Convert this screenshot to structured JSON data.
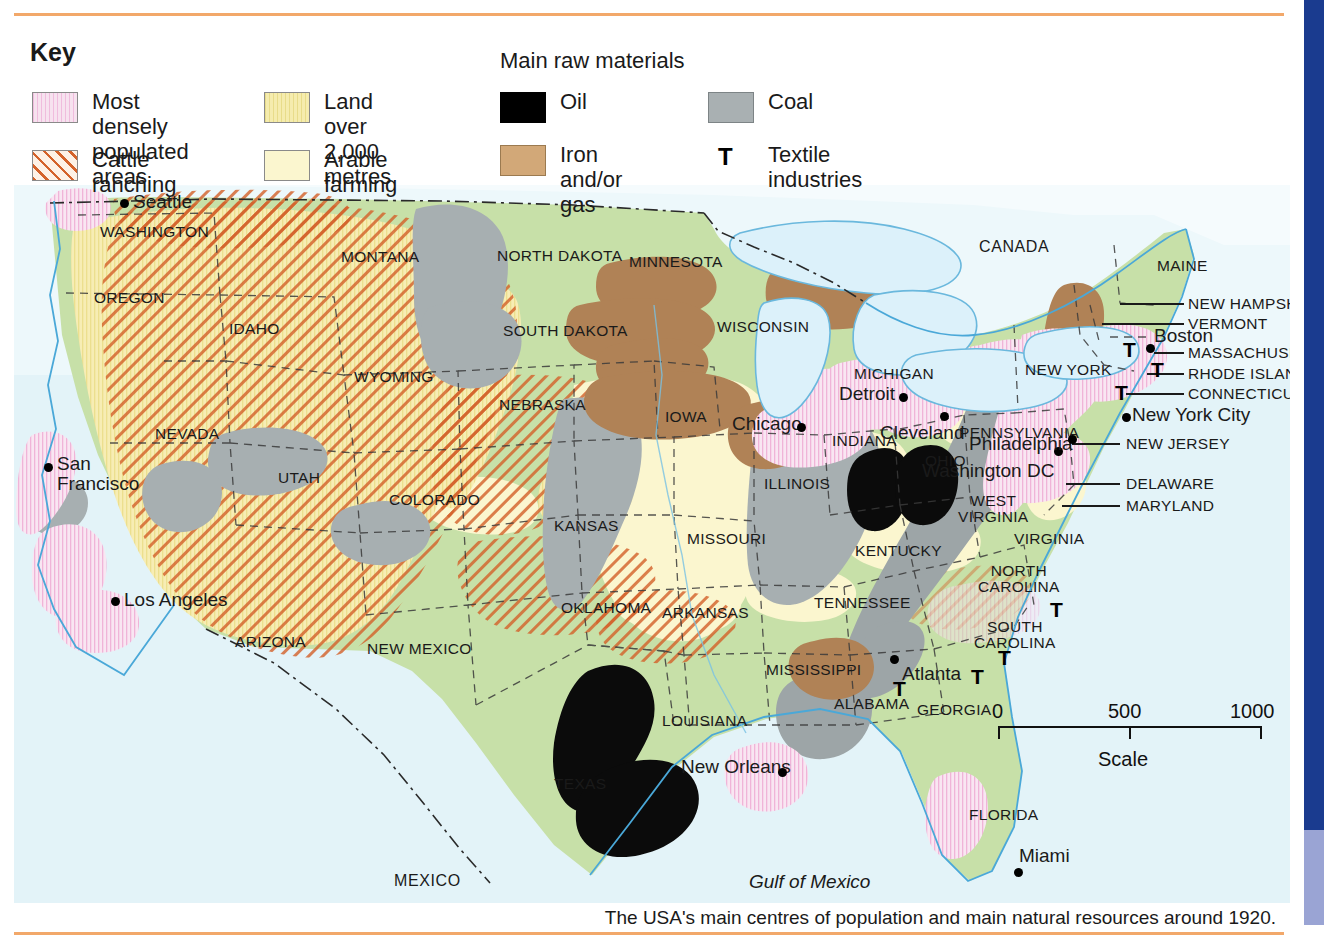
{
  "figure": {
    "top_rule_color": "#f2a86a",
    "page_edge_color": "#1a3b8f"
  },
  "legend": {
    "title": "Key",
    "raw_materials_heading": "Main raw materials",
    "items": [
      {
        "id": "most-densely-populated",
        "label": "Most densely\npopulated areas",
        "swatch": "pink-vertical-hatch",
        "color": "#f7e2ef"
      },
      {
        "id": "cattle-ranching",
        "label": "Cattle ranching",
        "swatch": "orange-diagonal-hatch",
        "color": "#d4622a"
      },
      {
        "id": "land-over-2000m",
        "label": "Land over\n2,000 metres",
        "swatch": "sand-vertical-hatch",
        "color": "#f5ecae"
      },
      {
        "id": "arable-farming",
        "label": "Arable farming",
        "swatch": "pale-yellow-solid",
        "color": "#fbf6cf"
      },
      {
        "id": "oil",
        "label": "Oil",
        "swatch": "black-solid",
        "color": "#000000"
      },
      {
        "id": "coal",
        "label": "Coal",
        "swatch": "grey-solid",
        "color": "#a9b0b2"
      },
      {
        "id": "iron-and-or-gas",
        "label": "Iron and/or gas",
        "swatch": "brown-solid",
        "color": "#d2a878"
      },
      {
        "id": "textile-industries",
        "label": "Textile industries",
        "swatch": "letter-T",
        "color": "#000000"
      }
    ]
  },
  "map": {
    "countries": [
      {
        "name": "CANADA",
        "x": 965,
        "y": 53
      },
      {
        "name": "MEXICO",
        "x": 380,
        "y": 687
      }
    ],
    "water": [
      {
        "name": "Gulf of Mexico",
        "x": 735,
        "y": 686
      }
    ],
    "states": [
      {
        "name": "WASHINGTON",
        "x": 86,
        "y": 38
      },
      {
        "name": "OREGON",
        "x": 80,
        "y": 104
      },
      {
        "name": "IDAHO",
        "x": 215,
        "y": 135
      },
      {
        "name": "MONTANA",
        "x": 327,
        "y": 63
      },
      {
        "name": "NORTH DAKOTA",
        "x": 483,
        "y": 62
      },
      {
        "name": "SOUTH DAKOTA",
        "x": 489,
        "y": 137
      },
      {
        "name": "MINNESOTA",
        "x": 615,
        "y": 68
      },
      {
        "name": "WISCONSIN",
        "x": 703,
        "y": 133
      },
      {
        "name": "WYOMING",
        "x": 340,
        "y": 183
      },
      {
        "name": "NEVADA",
        "x": 141,
        "y": 240
      },
      {
        "name": "UTAH",
        "x": 264,
        "y": 284
      },
      {
        "name": "COLORADO",
        "x": 375,
        "y": 306
      },
      {
        "name": "NEBRASKA",
        "x": 485,
        "y": 211
      },
      {
        "name": "IOWA",
        "x": 651,
        "y": 223
      },
      {
        "name": "MICHIGAN",
        "x": 840,
        "y": 180
      },
      {
        "name": "INDIANA",
        "x": 818,
        "y": 247
      },
      {
        "name": "ILLINOIS",
        "x": 750,
        "y": 290
      },
      {
        "name": "KANSAS",
        "x": 540,
        "y": 332
      },
      {
        "name": "MISSOURI",
        "x": 673,
        "y": 345
      },
      {
        "name": "OHIO",
        "x": 911,
        "y": 267
      },
      {
        "name": "KENTUCKY",
        "x": 841,
        "y": 357
      },
      {
        "name": "TENNESSEE",
        "x": 800,
        "y": 409
      },
      {
        "name": "OKLAHOMA",
        "x": 547,
        "y": 414
      },
      {
        "name": "ARKANSAS",
        "x": 648,
        "y": 419
      },
      {
        "name": "ARIZONA",
        "x": 221,
        "y": 448
      },
      {
        "name": "NEW MEXICO",
        "x": 353,
        "y": 455
      },
      {
        "name": "TEXAS",
        "x": 540,
        "y": 590
      },
      {
        "name": "LOUISIANA",
        "x": 648,
        "y": 527
      },
      {
        "name": "MISSISSIPPI",
        "x": 752,
        "y": 476
      },
      {
        "name": "ALABAMA",
        "x": 820,
        "y": 510
      },
      {
        "name": "GEORGIA",
        "x": 903,
        "y": 516
      },
      {
        "name": "FLORIDA",
        "x": 955,
        "y": 621
      },
      {
        "name": "VIRGINIA",
        "x": 1000,
        "y": 345
      },
      {
        "name": "PENNSYLVANIA",
        "x": 945,
        "y": 239
      },
      {
        "name": "NEW YORK",
        "x": 1011,
        "y": 176
      },
      {
        "name": "MAINE",
        "x": 1143,
        "y": 72
      }
    ],
    "states_two_line": [
      {
        "name": "WEST\nVIRGINIA",
        "x": 944,
        "y": 308
      },
      {
        "name": "NORTH\nCAROLINA",
        "x": 964,
        "y": 378
      },
      {
        "name": "SOUTH\nCAROLINA",
        "x": 960,
        "y": 434
      }
    ],
    "leader_states": [
      {
        "name": "NEW HAMPSHIRE",
        "label_x": 1174,
        "label_y": 110,
        "line_x": 1106,
        "line_w": 64,
        "line_y": 118
      },
      {
        "name": "VERMONT",
        "label_x": 1174,
        "label_y": 130,
        "line_x": 1088,
        "line_w": 82,
        "line_y": 138
      },
      {
        "name": "MASSACHUSETTS",
        "label_x": 1174,
        "label_y": 159,
        "line_x": 1140,
        "line_w": 30,
        "line_y": 167
      },
      {
        "name": "RHODE ISLAND",
        "label_x": 1174,
        "label_y": 180,
        "line_x": 1133,
        "line_w": 37,
        "line_y": 188
      },
      {
        "name": "CONNECTICUT",
        "label_x": 1174,
        "label_y": 200,
        "line_x": 1112,
        "line_w": 58,
        "line_y": 208
      },
      {
        "name": "NEW JERSEY",
        "label_x": 1112,
        "label_y": 250,
        "line_x": 1058,
        "line_w": 48,
        "line_y": 258
      },
      {
        "name": "DELAWARE",
        "label_x": 1112,
        "label_y": 290,
        "line_x": 1052,
        "line_w": 54,
        "line_y": 298
      },
      {
        "name": "MARYLAND",
        "label_x": 1112,
        "label_y": 312,
        "line_x": 1048,
        "line_w": 58,
        "line_y": 320
      }
    ],
    "cities": [
      {
        "name": "Seattle",
        "label_x": 119,
        "label_y": 6,
        "dot_x": 106,
        "dot_y": 14
      },
      {
        "name": "San\nFrancisco",
        "label_x": 43,
        "label_y": 269,
        "dot_x": 30,
        "dot_y": 278,
        "two_line": true
      },
      {
        "name": "Los Angeles",
        "label_x": 110,
        "label_y": 404,
        "dot_x": 97,
        "dot_y": 412
      },
      {
        "name": "Chicago",
        "label_x": 718,
        "label_y": 228,
        "dot_x": 783,
        "dot_y": 238
      },
      {
        "name": "Detroit",
        "label_x": 825,
        "label_y": 198,
        "dot_x": 885,
        "dot_y": 208
      },
      {
        "name": "Cleveland",
        "label_x": 866,
        "label_y": 237,
        "dot_x": 926,
        "dot_y": 227
      },
      {
        "name": "Washington DC",
        "label_x": 908,
        "label_y": 275,
        "dot_x": 1040,
        "dot_y": 262
      },
      {
        "name": "Philadelphia",
        "label_x": 955,
        "label_y": 248,
        "dot_x": 1054,
        "dot_y": 250
      },
      {
        "name": "New York City",
        "label_x": 1118,
        "label_y": 219,
        "dot_x": 1108,
        "dot_y": 228
      },
      {
        "name": "Boston",
        "label_x": 1140,
        "label_y": 140,
        "dot_x": 1132,
        "dot_y": 159
      },
      {
        "name": "Atlanta",
        "label_x": 888,
        "label_y": 478,
        "dot_x": 876,
        "dot_y": 470
      },
      {
        "name": "New Orleans",
        "label_x": 667,
        "label_y": 571,
        "dot_x": 764,
        "dot_y": 583
      },
      {
        "name": "Miami",
        "label_x": 1005,
        "label_y": 660,
        "dot_x": 1000,
        "dot_y": 683
      }
    ],
    "textile_markers": [
      {
        "x": 1109,
        "y": 153
      },
      {
        "x": 1137,
        "y": 173
      },
      {
        "x": 1101,
        "y": 196
      },
      {
        "x": 1036,
        "y": 413
      },
      {
        "x": 984,
        "y": 461
      },
      {
        "x": 957,
        "y": 480
      },
      {
        "x": 879,
        "y": 492
      }
    ]
  },
  "north_arrow": {
    "label": "N",
    "x": 1225,
    "y": 90
  },
  "scale": {
    "ticks": [
      "0",
      "500",
      "1000"
    ],
    "caption": "Scale",
    "x": 998,
    "y": 700
  },
  "caption": "The USA's main centres of population and main natural resources around 1920."
}
